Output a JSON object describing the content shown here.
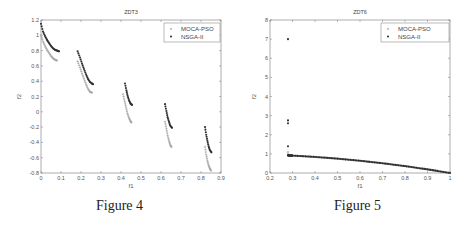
{
  "figures": [
    {
      "caption": "Figure 4"
    },
    {
      "caption": "Figure 5"
    }
  ],
  "chart_data": [
    {
      "type": "scatter",
      "title": "ZDT3",
      "xlabel": "f1",
      "ylabel": "f2",
      "xlim": [
        0,
        0.9
      ],
      "ylim": [
        -0.8,
        1.2
      ],
      "xticks": [
        "0",
        "0.1",
        "0.2",
        "0.3",
        "0.4",
        "0.5",
        "0.6",
        "0.7",
        "0.8",
        "0.9"
      ],
      "yticks": [
        "-0.8",
        "-0.6",
        "-0.4",
        "-0.2",
        "0",
        "0.2",
        "0.4",
        "0.6",
        "0.8",
        "1",
        "1.2"
      ],
      "grid": false,
      "legend_position": "upper right",
      "series": [
        {
          "name": "MOCA-PSO",
          "marker": "+",
          "color": "#a0a0a0",
          "segments": [
            {
              "x": [
                0.0,
                0.01,
                0.02,
                0.03,
                0.04,
                0.05,
                0.06,
                0.07,
                0.08
              ],
              "y": [
                1.0,
                0.92,
                0.86,
                0.81,
                0.77,
                0.73,
                0.7,
                0.68,
                0.67
              ]
            },
            {
              "x": [
                0.183,
                0.195,
                0.205,
                0.215,
                0.225,
                0.235,
                0.245,
                0.255
              ],
              "y": [
                0.66,
                0.58,
                0.5,
                0.43,
                0.36,
                0.3,
                0.26,
                0.25
              ]
            },
            {
              "x": [
                0.41,
                0.418,
                0.425,
                0.432,
                0.44,
                0.447,
                0.452
              ],
              "y": [
                0.23,
                0.14,
                0.06,
                -0.02,
                -0.08,
                -0.12,
                -0.14
              ]
            },
            {
              "x": [
                0.62,
                0.627,
                0.633,
                0.64,
                0.646,
                0.652
              ],
              "y": [
                -0.13,
                -0.22,
                -0.31,
                -0.38,
                -0.43,
                -0.46
              ]
            },
            {
              "x": [
                0.82,
                0.826,
                0.832,
                0.838,
                0.844,
                0.85
              ],
              "y": [
                -0.46,
                -0.56,
                -0.64,
                -0.7,
                -0.74,
                -0.77
              ]
            }
          ]
        },
        {
          "name": "NSGA-II",
          "marker": "*",
          "color": "#303030",
          "segments": [
            {
              "x": [
                0.0,
                0.01,
                0.02,
                0.03,
                0.04,
                0.05,
                0.06,
                0.07,
                0.08,
                0.09
              ],
              "y": [
                1.15,
                1.05,
                0.99,
                0.94,
                0.9,
                0.86,
                0.83,
                0.81,
                0.8,
                0.79
              ]
            },
            {
              "x": [
                0.183,
                0.195,
                0.205,
                0.215,
                0.225,
                0.235,
                0.245,
                0.255,
                0.26
              ],
              "y": [
                0.79,
                0.71,
                0.63,
                0.56,
                0.49,
                0.43,
                0.39,
                0.37,
                0.36
              ]
            },
            {
              "x": [
                0.42,
                0.427,
                0.433,
                0.44,
                0.447,
                0.455
              ],
              "y": [
                0.37,
                0.28,
                0.21,
                0.15,
                0.11,
                0.09
              ]
            },
            {
              "x": [
                0.62,
                0.627,
                0.633,
                0.64,
                0.646,
                0.655
              ],
              "y": [
                0.1,
                0.01,
                -0.07,
                -0.13,
                -0.18,
                -0.21
              ]
            },
            {
              "x": [
                0.82,
                0.826,
                0.832,
                0.838,
                0.844,
                0.852
              ],
              "y": [
                -0.2,
                -0.3,
                -0.38,
                -0.45,
                -0.5,
                -0.53
              ]
            }
          ]
        }
      ]
    },
    {
      "type": "scatter",
      "title": "ZDT6",
      "xlabel": "f1",
      "ylabel": "f2",
      "xlim": [
        0.2,
        1.0
      ],
      "ylim": [
        0,
        8
      ],
      "xticks": [
        "0.2",
        "0.3",
        "0.4",
        "0.5",
        "0.6",
        "0.7",
        "0.8",
        "0.9",
        "1"
      ],
      "yticks": [
        "0",
        "1",
        "2",
        "3",
        "4",
        "5",
        "6",
        "7",
        "8"
      ],
      "grid": false,
      "legend_position": "upper right",
      "series": [
        {
          "name": "MOCA-PSO",
          "marker": "+",
          "color": "#a0a0a0",
          "x": [
            0.28,
            0.28,
            0.28,
            0.3,
            0.4,
            0.5,
            0.6,
            0.7,
            0.8,
            0.9,
            1.0
          ],
          "y": [
            1.1,
            1.0,
            0.92,
            0.91,
            0.84,
            0.75,
            0.64,
            0.51,
            0.36,
            0.19,
            0.0
          ]
        },
        {
          "name": "NSGA-II",
          "marker": "*",
          "color": "#303030",
          "x": [
            0.28,
            0.28,
            0.28,
            0.28,
            0.28,
            0.3,
            0.4,
            0.5,
            0.6,
            0.7,
            0.8,
            0.9,
            1.0
          ],
          "y": [
            7.0,
            2.75,
            2.6,
            1.4,
            0.92,
            0.91,
            0.84,
            0.75,
            0.64,
            0.51,
            0.36,
            0.19,
            0.0
          ]
        }
      ]
    }
  ]
}
